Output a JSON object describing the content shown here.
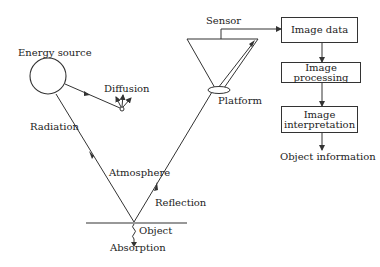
{
  "diagram": {
    "labels": {
      "energy_source": "Energy source",
      "diffusion": "Diffusion",
      "radiation": "Radiation",
      "atmosphere": "Atmosphere",
      "reflection": "Reflection",
      "object": "Object",
      "absorption": "Absorption",
      "sensor": "Sensor",
      "platform": "Platform"
    },
    "flow_boxes": [
      {
        "label": "Image data"
      },
      {
        "label": "Image processing"
      },
      {
        "label": "Image interpretation"
      }
    ],
    "output": "Object information",
    "colors": {
      "line": "#333333",
      "text": "#222222",
      "background": "#ffffff"
    }
  }
}
